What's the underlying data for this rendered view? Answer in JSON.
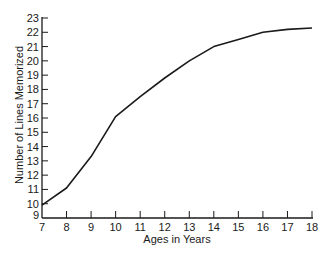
{
  "chart_data": {
    "type": "line",
    "title": "",
    "xlabel": "Ages in Years",
    "ylabel": "Number of Lines Memorized",
    "x": [
      7,
      8,
      9,
      10,
      11,
      12,
      13,
      14,
      15,
      16,
      17,
      18
    ],
    "series": [
      {
        "name": "Lines memorized",
        "values": [
          9.9,
          11.1,
          13.3,
          16.1,
          17.5,
          18.8,
          20.0,
          21.0,
          21.5,
          22.0,
          22.2,
          22.3
        ]
      }
    ],
    "xlim": [
      7,
      18
    ],
    "ylim": [
      9,
      23
    ],
    "x_ticks": [
      "7",
      "8",
      "9",
      "10",
      "11",
      "12",
      "13",
      "14",
      "15",
      "16",
      "17",
      "18"
    ],
    "y_ticks": [
      "9",
      "10",
      "11",
      "12",
      "13",
      "14",
      "15",
      "16",
      "17",
      "18",
      "19",
      "20",
      "21",
      "22",
      "23"
    ],
    "grid": false,
    "legend": "none",
    "colors": {
      "line": "#1a1a1a",
      "axis": "#1a1a1a",
      "background": "#ffffff"
    }
  }
}
